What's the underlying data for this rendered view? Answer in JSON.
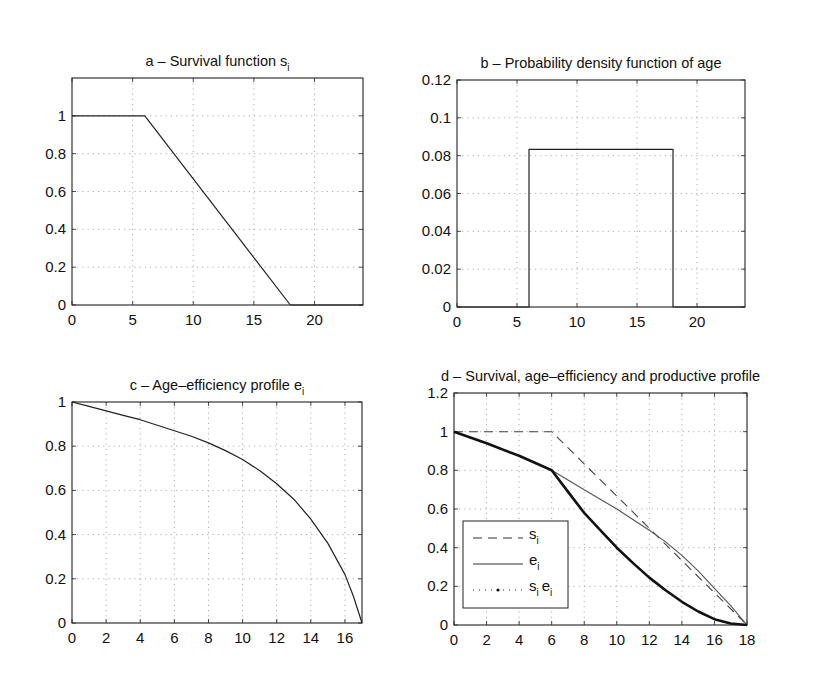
{
  "page": {
    "top_text": "... ping of the ... ... productive profile ... ... ... ... ..."
  },
  "chart_data": [
    {
      "id": "a",
      "type": "line",
      "title": "a – Survival function s",
      "title_sub": "i",
      "xlabel": "",
      "ylabel": "",
      "xlim": [
        0,
        24
      ],
      "ylim": [
        0,
        1.2
      ],
      "xticks": [
        0,
        5,
        10,
        15,
        20
      ],
      "yticks": [
        0,
        0.2,
        0.4,
        0.6,
        0.8,
        1
      ],
      "ytick_labels": [
        "0",
        "0.2",
        "0.4",
        "0.6",
        "0.8",
        "1"
      ],
      "grid": true,
      "series": [
        {
          "name": "s_i",
          "style": "solid",
          "width": 1.2,
          "x": [
            0,
            6,
            18,
            24
          ],
          "y": [
            1,
            1,
            0,
            0
          ]
        }
      ]
    },
    {
      "id": "b",
      "type": "line",
      "title": "b – Probability density function of age",
      "title_sub": "",
      "xlabel": "",
      "ylabel": "",
      "xlim": [
        0,
        24
      ],
      "ylim": [
        0,
        0.12
      ],
      "xticks": [
        0,
        5,
        10,
        15,
        20
      ],
      "yticks": [
        0,
        0.02,
        0.04,
        0.06,
        0.08,
        0.1,
        0.12
      ],
      "ytick_labels": [
        "0",
        "0.02",
        "0.04",
        "0.06",
        "0.08",
        "0.1",
        "0.12"
      ],
      "grid": true,
      "series": [
        {
          "name": "pdf",
          "style": "solid",
          "width": 1.2,
          "x": [
            0,
            6,
            6,
            18,
            18,
            24
          ],
          "y": [
            0,
            0,
            0.0833,
            0.0833,
            0,
            0
          ]
        }
      ]
    },
    {
      "id": "c",
      "type": "line",
      "title": "c – Age–efficiency profile e",
      "title_sub": "i",
      "xlabel": "",
      "ylabel": "",
      "xlim": [
        0,
        17
      ],
      "ylim": [
        0,
        1
      ],
      "xticks": [
        0,
        2,
        4,
        6,
        8,
        10,
        12,
        14,
        16
      ],
      "yticks": [
        0,
        0.2,
        0.4,
        0.6,
        0.8,
        1
      ],
      "ytick_labels": [
        "0",
        "0.2",
        "0.4",
        "0.6",
        "0.8",
        "1"
      ],
      "grid": true,
      "series": [
        {
          "name": "e_i",
          "style": "solid",
          "width": 1.2,
          "x": [
            0,
            1,
            2,
            3,
            4,
            5,
            6,
            7,
            8,
            9,
            10,
            11,
            12,
            13,
            14,
            15,
            16,
            16.5,
            17
          ],
          "y": [
            1,
            0.98,
            0.96,
            0.94,
            0.92,
            0.895,
            0.87,
            0.845,
            0.815,
            0.78,
            0.74,
            0.69,
            0.63,
            0.56,
            0.47,
            0.36,
            0.22,
            0.12,
            0
          ]
        }
      ]
    },
    {
      "id": "d",
      "type": "line",
      "title": "d – Survival, age–efficiency and productive profile",
      "title_sub": "",
      "xlabel": "",
      "ylabel": "",
      "xlim": [
        0,
        18
      ],
      "ylim": [
        0,
        1.2
      ],
      "xticks": [
        0,
        2,
        4,
        6,
        8,
        10,
        12,
        14,
        16,
        18
      ],
      "yticks": [
        0,
        0.2,
        0.4,
        0.6,
        0.8,
        1,
        1.2
      ],
      "ytick_labels": [
        "0",
        "0.2",
        "0.4",
        "0.6",
        "0.8",
        "1",
        "1.2"
      ],
      "grid": true,
      "legend": {
        "position": "lower-left",
        "entries": [
          {
            "label": "s",
            "sub": "i",
            "style": "dashed"
          },
          {
            "label": "e",
            "sub": "i",
            "style": "solid"
          },
          {
            "label": "s",
            "sub": "i",
            "label2": "e",
            "sub2": "i",
            "style": "dotted"
          }
        ]
      },
      "series": [
        {
          "name": "s_i",
          "style": "dashed",
          "width": 1.1,
          "x": [
            0,
            6,
            18
          ],
          "y": [
            1,
            1,
            0
          ]
        },
        {
          "name": "e_i",
          "style": "solid",
          "width": 1.1,
          "x": [
            0,
            2,
            4,
            6,
            8,
            10,
            12,
            13,
            14,
            15,
            16,
            17,
            18
          ],
          "y": [
            1,
            0.94,
            0.875,
            0.8,
            0.7,
            0.6,
            0.49,
            0.43,
            0.36,
            0.28,
            0.19,
            0.1,
            0
          ]
        },
        {
          "name": "s_i e_i",
          "style": "thick",
          "width": 2.6,
          "x": [
            0,
            2,
            4,
            6,
            7,
            8,
            9,
            10,
            11,
            12,
            13,
            14,
            15,
            16,
            17,
            18
          ],
          "y": [
            1,
            0.94,
            0.875,
            0.8,
            0.69,
            0.58,
            0.49,
            0.4,
            0.32,
            0.245,
            0.18,
            0.12,
            0.07,
            0.03,
            0.008,
            0
          ]
        }
      ]
    }
  ]
}
